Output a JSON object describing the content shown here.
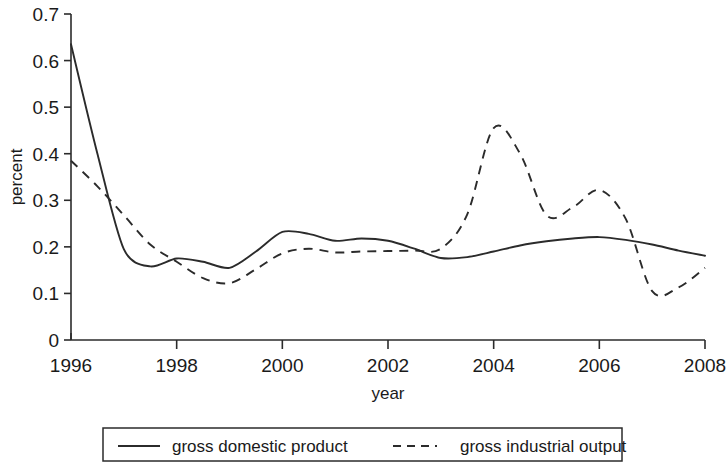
{
  "chart_data": {
    "type": "line",
    "title": "",
    "xlabel": "year",
    "ylabel": "percent",
    "xlim": [
      1996,
      2008
    ],
    "ylim": [
      0,
      0.7
    ],
    "grid": false,
    "legend_position": "bottom",
    "x_ticks": [
      "1996",
      "1998",
      "2000",
      "2002",
      "2004",
      "2006",
      "2008"
    ],
    "x_tick_values": [
      1996,
      1998,
      2000,
      2002,
      2004,
      2006,
      2008
    ],
    "y_ticks": [
      "0",
      "0.1",
      "0.2",
      "0.3",
      "0.4",
      "0.5",
      "0.6",
      "0.7"
    ],
    "y_tick_values": [
      0,
      0.1,
      0.2,
      0.3,
      0.4,
      0.5,
      0.6,
      0.7
    ],
    "x": [
      1996,
      1996.5,
      1997,
      1997.5,
      1998,
      1998.5,
      1999,
      1999.5,
      2000,
      2000.5,
      2001,
      2001.5,
      2002,
      2002.5,
      2003,
      2003.5,
      2004,
      2004.5,
      2005,
      2005.5,
      2006,
      2006.5,
      2007,
      2007.5,
      2008
    ],
    "series": [
      {
        "name": "gross domestic product",
        "style": "solid",
        "color": "#2b2b2b",
        "values": [
          0.635,
          0.4,
          0.195,
          0.158,
          0.175,
          0.168,
          0.155,
          0.19,
          0.232,
          0.228,
          0.213,
          0.218,
          0.213,
          0.196,
          0.176,
          0.178,
          0.19,
          0.203,
          0.212,
          0.218,
          0.221,
          0.215,
          0.205,
          0.192,
          0.181
        ]
      },
      {
        "name": "gross industrial output",
        "style": "dashed",
        "color": "#2b2b2b",
        "values": [
          0.385,
          0.33,
          0.268,
          0.205,
          0.168,
          0.133,
          0.122,
          0.152,
          0.186,
          0.196,
          0.188,
          0.19,
          0.191,
          0.192,
          0.196,
          0.27,
          0.455,
          0.4,
          0.268,
          0.285,
          0.322,
          0.26,
          0.105,
          0.113,
          0.155
        ]
      }
    ],
    "annotations": []
  },
  "legend": {
    "items": [
      {
        "label": "gross domestic product",
        "style": "solid"
      },
      {
        "label": "gross industrial output",
        "style": "dashed"
      }
    ]
  }
}
